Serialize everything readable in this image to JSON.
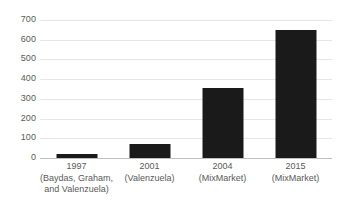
{
  "chart_data": {
    "type": "bar",
    "title": "",
    "subtitle": "",
    "xlabel": "",
    "ylabel": "",
    "categories": [
      "1997 (Baydas, Graham, and Valenzuela)",
      "2001 (Valenzuela)",
      "2004 (MixMarket)",
      "2015 (MixMarket)"
    ],
    "values": [
      20,
      70,
      355,
      650
    ],
    "ylim": [
      0,
      700
    ],
    "yticks": [
      0,
      100,
      200,
      300,
      400,
      500,
      600,
      700
    ],
    "ytick_labels": [
      "0",
      "100",
      "200",
      "300",
      "400",
      "500",
      "600",
      "700"
    ],
    "grid": true,
    "legend": "none",
    "bar_color": "#1a1a1a",
    "gridline_color": "#e6e6e6",
    "axis_color": "#bfbfbf",
    "tick_label_color": "#595959"
  },
  "x_axis": {
    "ticks": [
      {
        "year": "1997",
        "source": "(Baydas, Graham,",
        "source2": "and Valenzuela)"
      },
      {
        "year": "2001",
        "source": "(Valenzuela)",
        "source2": ""
      },
      {
        "year": "2004",
        "source": "(MixMarket)",
        "source2": ""
      },
      {
        "year": "2015",
        "source": "(MixMarket)",
        "source2": ""
      }
    ]
  }
}
